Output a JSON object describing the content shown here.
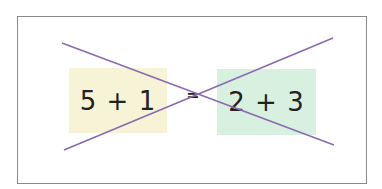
{
  "diagram": {
    "left_expression": "5 + 1",
    "equals_sign": "=",
    "right_expression": "2 + 3",
    "colors": {
      "left_box": "#f7f3d6",
      "right_box": "#d8f0df",
      "cross_lines": "#8a6bb0",
      "frame_border": "#8a8a8a",
      "text": "#222222"
    },
    "cross_lines": [
      {
        "x1": 62,
        "y1": 43,
        "x2": 334,
        "y2": 145
      },
      {
        "x1": 64,
        "y1": 150,
        "x2": 333,
        "y2": 38
      }
    ]
  }
}
